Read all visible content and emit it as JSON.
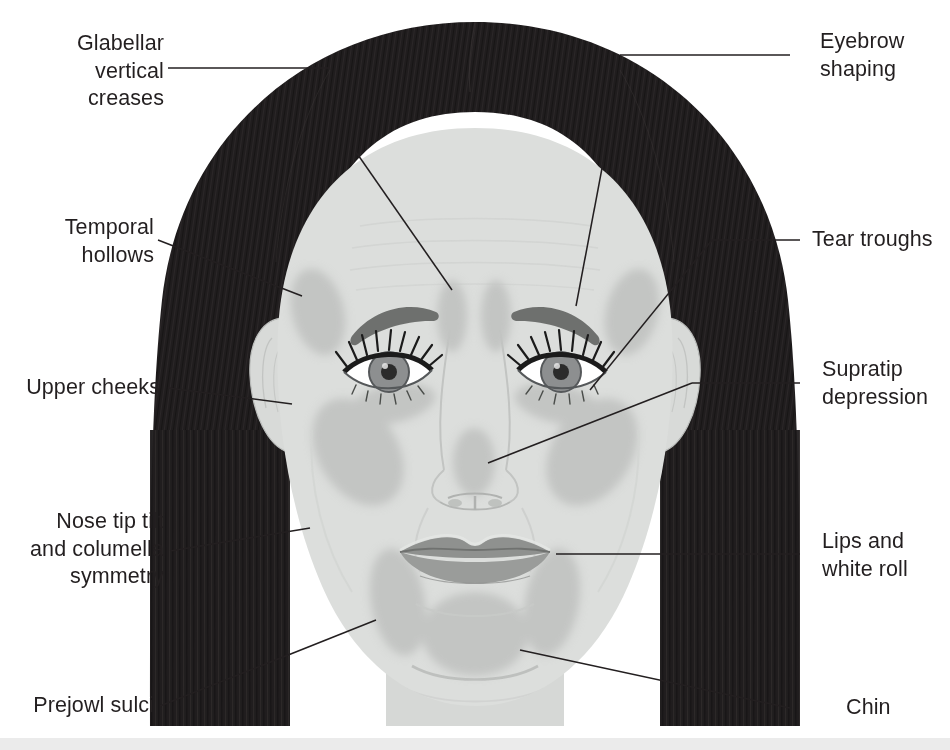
{
  "diagram": {
    "background_color": "#ffffff",
    "text_color": "#231f20",
    "leader_line_color": "#231f20",
    "palette": {
      "hair": "#231f20",
      "skin": "#dcdedc",
      "skin_shadow": "#d2d4d2",
      "treatment_zone": "#c3c5c3",
      "lips": "#9a9c9a",
      "lips_dark": "#8b8d8b",
      "eyebrow": "#6e706e",
      "iris": "#8d8f90",
      "pupil": "#2b2b2b",
      "sclera": "#ffffff",
      "lash": "#1b1b1b",
      "bottom_strip": "#ebebeb"
    }
  },
  "labels": {
    "left": [
      {
        "id": "glabellar-vertical-creases",
        "text": "Glabellar\nvertical\ncreases"
      },
      {
        "id": "temporal-hollows",
        "text": "Temporal\nhollows"
      },
      {
        "id": "upper-cheeks",
        "text": "Upper cheeks"
      },
      {
        "id": "nose-tip-tilt",
        "text": "Nose tip tilt\nand columella\nsymmetry"
      },
      {
        "id": "prejowl-sulci",
        "text": "Prejowl sulci"
      }
    ],
    "right": [
      {
        "id": "eyebrow-shaping",
        "text": "Eyebrow\nshaping"
      },
      {
        "id": "tear-troughs",
        "text": "Tear troughs"
      },
      {
        "id": "supratip-depression",
        "text": "Supratip\ndepression"
      },
      {
        "id": "lips-and-white-roll",
        "text": "Lips and\nwhite roll"
      },
      {
        "id": "chin",
        "text": "Chin"
      }
    ]
  },
  "treatment_zones": [
    "glabellar vertical creases",
    "eyebrow shaping",
    "temporal hollows",
    "tear troughs",
    "upper cheeks",
    "supratip depression",
    "nose tip tilt and columella symmetry",
    "lips and white roll",
    "prejowl sulci",
    "chin"
  ]
}
